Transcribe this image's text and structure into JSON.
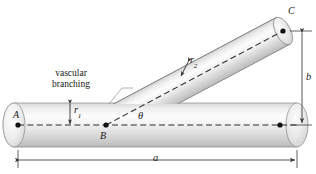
{
  "figure": {
    "caption": {
      "line1": "vascular",
      "line2": "branching"
    },
    "points": {
      "A": "A",
      "B": "B",
      "C": "C"
    },
    "dimensions": {
      "a": "a",
      "b": "b",
      "r1_base": "r",
      "r1_sub": "1",
      "r2_base": "r",
      "r2_sub": "2"
    },
    "angle": {
      "theta": "θ"
    },
    "colors": {
      "stroke": "#4a4a4a",
      "dash": "#2b2b2b",
      "text": "#161616",
      "cylinder_light": "#fbfbfb",
      "cylinder_mid": "#e2e2e2",
      "cylinder_dark": "#b9b9b9",
      "background": "#ffffff"
    },
    "geometry": {
      "main_axis_y": 125,
      "main_left_x": 14,
      "main_right_x": 297,
      "main_radius": 22,
      "branch_angle_deg": 33,
      "branch_radius": 15,
      "point_A": [
        18,
        125
      ],
      "point_B": [
        106,
        125
      ],
      "point_C": [
        283,
        31
      ],
      "a_value": "a",
      "b_value": "b"
    }
  }
}
